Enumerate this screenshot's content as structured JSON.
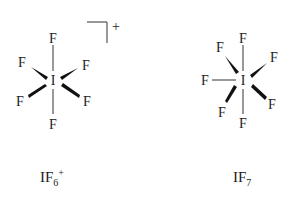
{
  "diagram": {
    "molecules": [
      {
        "id": "IF6+",
        "central_atom": "I",
        "ligand": "F",
        "ligand_count": 6,
        "charge_symbol": "+",
        "formula": {
          "main": "IF",
          "subscript": "6",
          "superscript": "+"
        }
      },
      {
        "id": "IF7",
        "central_atom": "I",
        "ligand": "F",
        "ligand_count": 7,
        "formula": {
          "main": "IF",
          "subscript": "7"
        }
      }
    ],
    "atoms": {
      "central": "I",
      "ligand": "F"
    },
    "charge": "+",
    "colors": {
      "ink": "#222222",
      "background": "#ffffff"
    }
  }
}
